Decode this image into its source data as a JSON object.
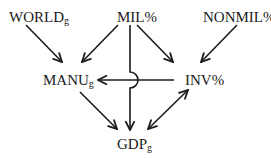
{
  "diagram": {
    "nodes": [
      {
        "id": "world",
        "label": "WORLD",
        "sub": "g"
      },
      {
        "id": "mil",
        "label": "MIL%",
        "sub": ""
      },
      {
        "id": "nonmil",
        "label": "NONMIL%",
        "sub": ""
      },
      {
        "id": "manu",
        "label": "MANU",
        "sub": "g"
      },
      {
        "id": "inv",
        "label": "INV%",
        "sub": ""
      },
      {
        "id": "gdp",
        "label": "GDP",
        "sub": "g"
      }
    ],
    "edges": [
      {
        "from": "world",
        "to": "manu",
        "type": "directed"
      },
      {
        "from": "mil",
        "to": "manu",
        "type": "directed"
      },
      {
        "from": "mil",
        "to": "inv",
        "type": "directed"
      },
      {
        "from": "mil",
        "to": "gdp",
        "type": "directed",
        "note": "hops over INV%→MANUg line"
      },
      {
        "from": "nonmil",
        "to": "inv",
        "type": "directed"
      },
      {
        "from": "inv",
        "to": "manu",
        "type": "directed"
      },
      {
        "from": "manu",
        "to": "gdp",
        "type": "directed"
      },
      {
        "from": "inv",
        "to": "gdp",
        "type": "bidirectional"
      }
    ]
  }
}
